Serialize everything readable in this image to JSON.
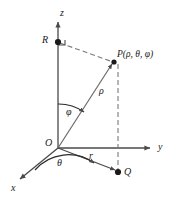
{
  "figure": {
    "background_color": "#ffffff",
    "stroke_color": "#4a4a4a",
    "text_color": "#1a1a1a",
    "width": 171,
    "height": 198
  },
  "axes": [
    {
      "key": "z",
      "label": "z",
      "direction": "up",
      "label_x": 60,
      "label_y": 8
    },
    {
      "key": "y",
      "label": "y",
      "direction": "right",
      "label_x": 158,
      "label_y": 143
    },
    {
      "key": "x",
      "label": "x",
      "direction": "down-left",
      "label_x": 11,
      "label_y": 183
    }
  ],
  "points": [
    {
      "key": "R",
      "label": "R",
      "x": 58,
      "y": 42,
      "label_x": 43,
      "label_y": 36
    },
    {
      "key": "O",
      "label": "O",
      "x": 58,
      "y": 148,
      "label_x": 45,
      "label_y": 139
    },
    {
      "key": "P",
      "label": "P",
      "x": 114,
      "y": 62,
      "label_x": 117,
      "label_y": 50
    },
    {
      "key": "Q",
      "label": "Q",
      "x": 118,
      "y": 172,
      "label_x": 124,
      "label_y": 169
    }
  ],
  "point_label_P": {
    "name": "P",
    "full": "P(ρ, θ, φ)",
    "coordinates": [
      "ρ",
      "θ",
      "φ"
    ]
  },
  "segments": [
    {
      "key": "rho",
      "label": "ρ",
      "from": "O",
      "to": "P",
      "style": "solid-arrow",
      "label_x": 99,
      "label_y": 88
    },
    {
      "key": "r",
      "label": "r",
      "from": "O",
      "to": "Q",
      "style": "solid-arrow",
      "label_x": 89,
      "label_y": 153
    },
    {
      "key": "RP",
      "label": "",
      "from": "R",
      "to": "P",
      "style": "dashed"
    },
    {
      "key": "PQ",
      "label": "",
      "from": "P",
      "to": "Q",
      "style": "dashed"
    },
    {
      "key": "OR",
      "label": "",
      "from": "O",
      "to": "R",
      "style": "solid"
    }
  ],
  "angles": [
    {
      "key": "phi",
      "label": "φ",
      "between": [
        "z-axis",
        "rho"
      ],
      "label_x": 66,
      "label_y": 108
    },
    {
      "key": "theta",
      "label": "θ",
      "between": [
        "x-axis",
        "r"
      ],
      "label_x": 57,
      "label_y": 159
    }
  ],
  "markers": [
    {
      "key": "right-angle-at-R",
      "type": "right-angle",
      "at": "R"
    }
  ]
}
